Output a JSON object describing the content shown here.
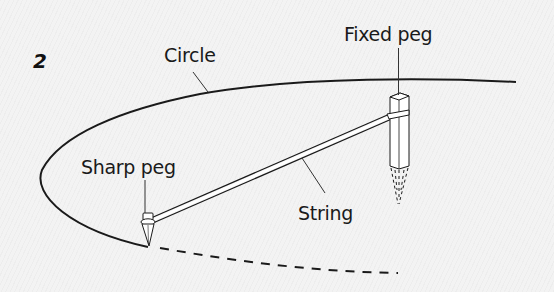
{
  "figure": {
    "number": "2",
    "labels": {
      "circle": "Circle",
      "fixed_peg": "Fixed peg",
      "sharp_peg": "Sharp peg",
      "string": "String"
    },
    "colors": {
      "line": "#1a1a1a",
      "background": "#f3f3f3",
      "peg_fill": "#ffffff"
    }
  }
}
